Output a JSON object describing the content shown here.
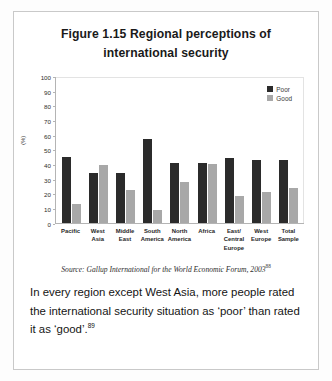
{
  "figure": {
    "title": "Figure 1.15 Regional perceptions of international security",
    "source": "Source: Gallup International for the World Economic Forum, 2003",
    "source_superscript": "88",
    "body_text": "In every region except West Asia, more people rated the international security situation as ‘poor’ than rated it as ‘good’.",
    "body_superscript": "89"
  },
  "colors": {
    "poor": "#2b2b2b",
    "good": "#a8a8a8",
    "border": "#c9c9c9",
    "axis": "#b4b4b4"
  },
  "chart_data": {
    "type": "bar",
    "title": "Figure 1.15 Regional perceptions of international security",
    "xlabel": "",
    "ylabel": "(%)",
    "ylim": [
      0,
      100
    ],
    "ytick_step": 10,
    "yticks": [
      0,
      10,
      20,
      30,
      40,
      50,
      60,
      70,
      80,
      90,
      100
    ],
    "grid": false,
    "legend_position": "top-right",
    "categories": [
      "Pacific",
      "West Asia",
      "Middle East",
      "South America",
      "North America",
      "Africa",
      "East/ Central Europe",
      "West Europe",
      "Total Sample"
    ],
    "series": [
      {
        "name": "Poor",
        "color": "#2b2b2b",
        "values": [
          45,
          34,
          34,
          57,
          41,
          41,
          44,
          43,
          43
        ]
      },
      {
        "name": "Good",
        "color": "#a8a8a8",
        "values": [
          13,
          39,
          22,
          9,
          28,
          40,
          18,
          21,
          24
        ]
      }
    ]
  }
}
